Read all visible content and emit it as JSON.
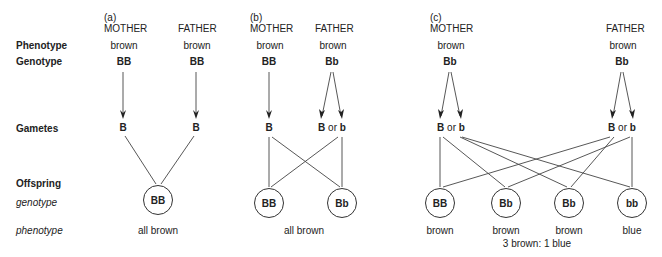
{
  "row_labels": {
    "phenotype": "Phenotype",
    "genotype": "Genotype",
    "gametes": "Gametes",
    "offspring": "Offspring",
    "offspring_genotype": "genotype",
    "offspring_phenotype": "phenotype"
  },
  "panels": {
    "a": {
      "tag": "(a)",
      "mother": {
        "label": "MOTHER",
        "phenotype": "brown",
        "genotype": "BB",
        "gametes": "B"
      },
      "father": {
        "label": "FATHER",
        "phenotype": "brown",
        "genotype": "BB",
        "gametes": "B"
      },
      "offspring": [
        "BB"
      ],
      "phenotype_summary": "all brown"
    },
    "b": {
      "tag": "(b)",
      "mother": {
        "label": "MOTHER",
        "phenotype": "brown",
        "genotype": "BB",
        "gametes": "B"
      },
      "father": {
        "label": "FATHER",
        "phenotype": "brown",
        "genotype": "Bb",
        "gamete1": "B",
        "or": "or",
        "gamete2": "b"
      },
      "offspring": [
        "BB",
        "Bb"
      ],
      "phenotype_summary": "all brown"
    },
    "c": {
      "tag": "(c)",
      "mother": {
        "label": "MOTHER",
        "phenotype": "brown",
        "genotype": "Bb",
        "gamete1": "B",
        "or": "or",
        "gamete2": "b"
      },
      "father": {
        "label": "FATHER",
        "phenotype": "brown",
        "genotype": "Bb",
        "gamete1": "B",
        "or": "or",
        "gamete2": "b"
      },
      "offspring": [
        "BB",
        "Bb",
        "Bb",
        "bb"
      ],
      "offspring_phenotypes": [
        "brown",
        "brown",
        "brown",
        "blue"
      ],
      "ratio": "3 brown: 1 blue"
    }
  },
  "colors": {
    "line": "#444444",
    "text": "#222222",
    "background": "#ffffff"
  }
}
